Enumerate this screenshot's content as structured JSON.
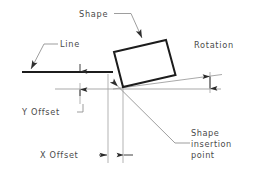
{
  "diagram": {
    "background_color": "#ffffff",
    "ink_color": "#1c1c1c",
    "label_color": "#4a4a4a",
    "thin_line_color": "#9a9a9a",
    "labels": {
      "shape": "Shape",
      "line": "Line",
      "rotation": "Rotation",
      "y_offset": "Y Offset",
      "x_offset": "X Offset",
      "insertion_point_line1": "Shape",
      "insertion_point_line2": "insertion",
      "insertion_point_line3": "point"
    },
    "geometry": {
      "base_line": {
        "x1": 22,
        "y1": 72,
        "x2": 113,
        "y2": 72
      },
      "reference_line": {
        "x1": 55,
        "y1": 89,
        "x2": 221,
        "y2": 89
      },
      "rotated_line": {
        "x1": 113,
        "y1": 89,
        "x2": 221,
        "y2": 75
      },
      "shape_rect": {
        "p1": {
          "x": 114,
          "y": 52
        },
        "p2": {
          "x": 166,
          "y": 40
        },
        "p3": {
          "x": 175,
          "y": 75
        },
        "p4": {
          "x": 122,
          "y": 87
        }
      },
      "insertion_point": {
        "x": 118,
        "y": 86
      },
      "x_offset_extension_left": {
        "x": 108,
        "y1": 76,
        "y2": 160
      },
      "x_offset_extension_right": {
        "x": 123,
        "y1": 90,
        "y2": 160
      },
      "y_offset_dim_x": 80,
      "rotation_dim_x": 210
    }
  }
}
